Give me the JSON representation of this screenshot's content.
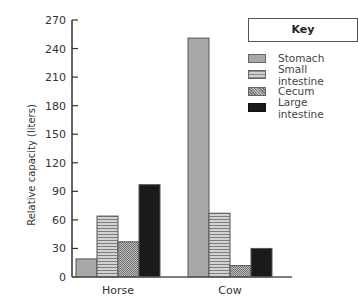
{
  "chart_data": {
    "type": "bar",
    "title": "",
    "xlabel": "",
    "ylabel": "Relative capacity (liters)",
    "ylim": [
      0,
      270
    ],
    "yticks": [
      0,
      30,
      60,
      90,
      120,
      150,
      180,
      210,
      240,
      270
    ],
    "categories": [
      "Horse",
      "Cow"
    ],
    "series": [
      {
        "name": "Stomach",
        "values": [
          19,
          251
        ],
        "color": "#a9a9a9",
        "pattern": "solid-gray"
      },
      {
        "name": "Small intestine",
        "values": [
          64,
          67
        ],
        "color": "#b0b0b0",
        "pattern": "horizontal-stripes"
      },
      {
        "name": "Cecum",
        "values": [
          37,
          12
        ],
        "color": "#999999",
        "pattern": "crosshatch"
      },
      {
        "name": "Large intestine",
        "values": [
          97,
          30
        ],
        "color": "#1a1a1a",
        "pattern": "solid-black"
      }
    ],
    "legend": {
      "title": "Key",
      "position": "top-right"
    },
    "grid": false
  },
  "key": {
    "title": "Key",
    "items": [
      "Stomach",
      "Small intestine",
      "Cecum",
      "Large intestine"
    ]
  }
}
